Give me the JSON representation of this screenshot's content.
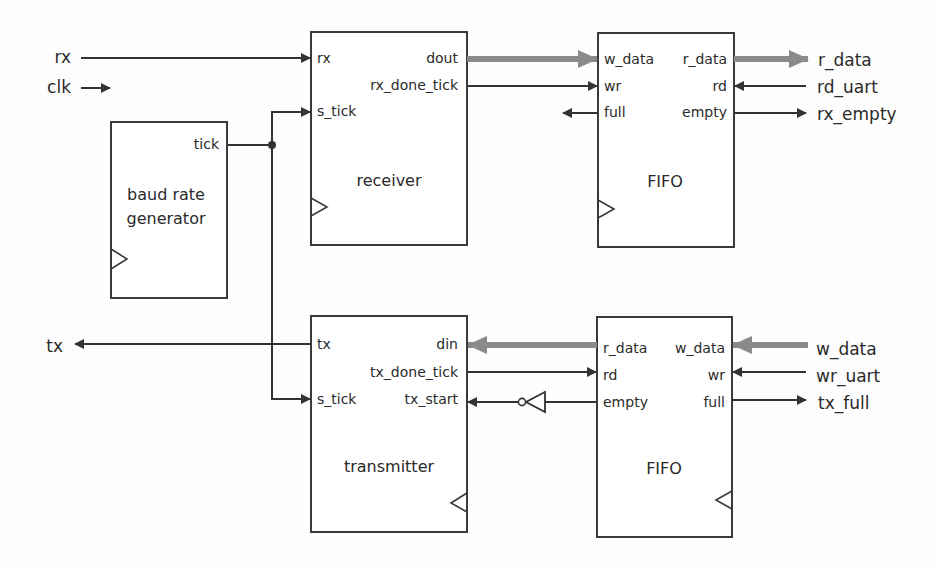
{
  "diagram": {
    "type": "block-diagram",
    "subject": "UART",
    "colors": {
      "wire": "#333333",
      "bus": "#8a8a8a",
      "box_stroke": "#3a3a3a"
    },
    "external_signals": {
      "rx": "rx",
      "clk": "clk",
      "tx": "tx",
      "r_data": "r_data",
      "rd_uart": "rd_uart",
      "rx_empty": "rx_empty",
      "w_data": "w_data",
      "wr_uart": "wr_uart",
      "tx_full": "tx_full"
    },
    "blocks": {
      "baud": {
        "title_line1": "baud rate",
        "title_line2": "generator",
        "ports": {
          "tick": "tick"
        }
      },
      "receiver": {
        "title": "receiver",
        "ports": {
          "rx": "rx",
          "s_tick": "s_tick",
          "dout": "dout",
          "rx_done_tick": "rx_done_tick"
        }
      },
      "rx_fifo": {
        "title": "FIFO",
        "ports": {
          "w_data": "w_data",
          "wr": "wr",
          "full": "full",
          "r_data": "r_data",
          "rd": "rd",
          "empty": "empty"
        }
      },
      "transmitter": {
        "title": "transmitter",
        "ports": {
          "tx": "tx",
          "s_tick": "s_tick",
          "din": "din",
          "tx_done_tick": "tx_done_tick",
          "tx_start": "tx_start"
        }
      },
      "tx_fifo": {
        "title": "FIFO",
        "ports": {
          "r_data": "r_data",
          "rd": "rd",
          "empty": "empty",
          "w_data": "w_data",
          "wr": "wr",
          "full": "full"
        }
      }
    }
  }
}
